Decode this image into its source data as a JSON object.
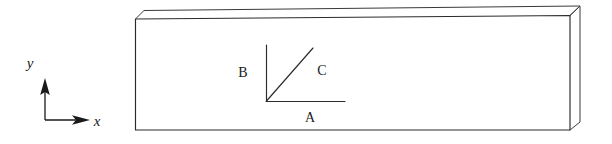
{
  "figure": {
    "background_color": "#ffffff",
    "line_color": "#2b2b2b",
    "text_color": "#1a1a1a",
    "width": 612,
    "height": 144
  },
  "axes": {
    "name": "global-coordinate-axes",
    "origin": {
      "x": 45,
      "y": 120
    },
    "y_axis": {
      "label": "y",
      "from": {
        "x": 45,
        "y": 120
      },
      "to": {
        "x": 45,
        "y": 82
      },
      "label_pos": {
        "x": 30,
        "y": 68
      },
      "arrow": "filled-triangle",
      "direction": "up"
    },
    "x_axis": {
      "label": "x",
      "from": {
        "x": 45,
        "y": 120
      },
      "to": {
        "x": 88,
        "y": 120
      },
      "label_pos": {
        "x": 97,
        "y": 126
      },
      "arrow": "filled-triangle",
      "direction": "right"
    }
  },
  "slab": {
    "name": "rectangular-slab-3d",
    "front_face": {
      "top_left": {
        "x": 135,
        "y": 19
      },
      "top_right": {
        "x": 570,
        "y": 15
      },
      "bottom_right": {
        "x": 570,
        "y": 130
      },
      "bottom_left": {
        "x": 135,
        "y": 130
      }
    },
    "top_face": {
      "front_left": {
        "x": 135,
        "y": 19
      },
      "back_left": {
        "x": 144,
        "y": 11
      },
      "back_right": {
        "x": 580,
        "y": 6
      },
      "front_right": {
        "x": 570,
        "y": 15
      }
    },
    "right_face": {
      "front_top": {
        "x": 570,
        "y": 15
      },
      "back_top": {
        "x": 580,
        "y": 6
      },
      "back_bottom": {
        "x": 580,
        "y": 122
      },
      "front_bottom": {
        "x": 570,
        "y": 130
      }
    }
  },
  "vectors": {
    "name": "local-vector-triad",
    "vertex": {
      "x": 266,
      "y": 101
    },
    "items": [
      {
        "label": "B",
        "name": "vector-b",
        "from": {
          "x": 266,
          "y": 101
        },
        "to": {
          "x": 266,
          "y": 45
        },
        "label_pos": {
          "x": 243,
          "y": 77
        },
        "orientation": "vertical"
      },
      {
        "label": "C",
        "name": "vector-c",
        "from": {
          "x": 266,
          "y": 101
        },
        "to": {
          "x": 313,
          "y": 48
        },
        "label_pos": {
          "x": 322,
          "y": 75
        },
        "orientation": "diagonal"
      },
      {
        "label": "A",
        "name": "vector-a",
        "from": {
          "x": 266,
          "y": 101
        },
        "to": {
          "x": 345,
          "y": 101
        },
        "label_pos": {
          "x": 310,
          "y": 122
        },
        "orientation": "horizontal"
      }
    ]
  }
}
